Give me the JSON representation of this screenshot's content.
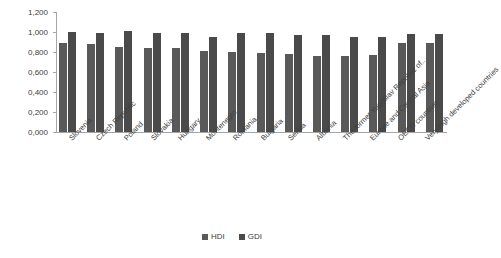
{
  "chart_data": {
    "type": "bar",
    "title": "",
    "xlabel": "",
    "ylabel": "",
    "ylim": [
      0,
      1.2
    ],
    "grid": false,
    "legend_position": "bottom",
    "y_ticks": [
      "0,000",
      "0,200",
      "0,400",
      "0,600",
      "0,800",
      "1,000",
      "1,200"
    ],
    "y_tick_values": [
      0.0,
      0.2,
      0.4,
      0.6,
      0.8,
      1.0,
      1.2
    ],
    "categories": [
      "Slovenia",
      "Czech Republic",
      "Poland",
      "Slovakia",
      "Hungary",
      "Montenegro",
      "Romania",
      "Bulgaria",
      "Serbia",
      "Albania",
      "The former Yugoslav Republic of..",
      "Europe and Central Asia",
      "OECD countries",
      "Very high developed countries"
    ],
    "series": [
      {
        "name": "HDI",
        "color": "#595959",
        "values": [
          0.89,
          0.878,
          0.855,
          0.845,
          0.836,
          0.807,
          0.802,
          0.794,
          0.776,
          0.764,
          0.757,
          0.771,
          0.887,
          0.892
        ]
      },
      {
        "name": "GDI",
        "color": "#4a4a4a",
        "values": [
          1.003,
          0.986,
          1.007,
          0.995,
          0.988,
          0.955,
          0.99,
          0.992,
          0.973,
          0.967,
          0.951,
          0.953,
          0.976,
          0.979
        ]
      }
    ]
  },
  "legend": {
    "items": [
      {
        "label": "HDI"
      },
      {
        "label": "GDI"
      }
    ]
  }
}
